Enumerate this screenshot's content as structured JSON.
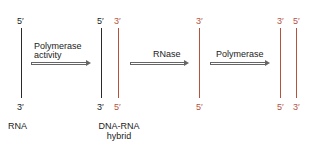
{
  "prime_labels": {
    "rna_top": "5′",
    "rna_bottom": "3′",
    "hybrid_dna_top": "5′",
    "hybrid_dna_bottom": "3′",
    "hybrid_new_top": "3′",
    "hybrid_new_bottom": "5′",
    "single_top": "3′",
    "single_bottom": "5′",
    "final_a_top": "3′",
    "final_a_bottom": "5′",
    "final_b_top": "5′",
    "final_b_bottom": "3′"
  },
  "steps": {
    "step1": {
      "line1": "Polymerase",
      "line2": "activity"
    },
    "step2": {
      "label": "RNase"
    },
    "step3": {
      "label": "Polymerase"
    }
  },
  "captions": {
    "rna": "RNA",
    "hybrid_line1": "DNA-RNA",
    "hybrid_line2": "hybrid"
  },
  "colors": {
    "original_strand": "#2a2a2a",
    "new_strand": "#b5513f"
  }
}
